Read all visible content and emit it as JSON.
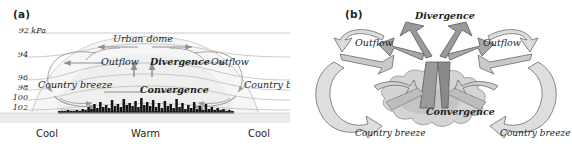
{
  "figure": {
    "width": 572,
    "height": 157,
    "background": "#ffffff"
  },
  "panel_a": {
    "label": "(a)",
    "type": "cross-section diagram",
    "pressure_axis": {
      "unit_label": "92 kPa",
      "ticks": [
        {
          "value": "92 kPa",
          "y": 31
        },
        {
          "value": "94",
          "y": 55
        },
        {
          "value": "96",
          "y": 78
        },
        {
          "value": "98",
          "y": 88
        },
        {
          "value": "100",
          "y": 98
        },
        {
          "value": "102",
          "y": 108
        }
      ]
    },
    "labels": {
      "urban_dome": "Urban dome",
      "outflow_left": "Outflow",
      "divergence": "Divergence",
      "outflow_right": "Outflow",
      "convergence": "Convergence",
      "country_breeze_left": "Country breeze",
      "country_breeze_right": "Country breeze"
    },
    "ground_labels": {
      "left": "Cool",
      "center": "Warm",
      "right": "Cool"
    },
    "colors": {
      "isobar": "#b5b5b5",
      "arrow": "#9a9a9a",
      "dome_fill": "#f2f2f2",
      "skyline": "#1a1a1a",
      "ground": "#e8e8e8",
      "text": "#231f20"
    }
  },
  "panel_b": {
    "label": "(b)",
    "type": "three-dimensional perspective diagram",
    "labels": {
      "divergence": "Divergence",
      "outflow_left": "Outflow",
      "outflow_right": "Outflow",
      "convergence": "Convergence",
      "country_breeze_left": "Country breeze",
      "country_breeze_right": "Country breeze"
    },
    "colors": {
      "arrow_light": "#d8d8d8",
      "arrow_mid": "#b0b0b0",
      "arrow_dark": "#8a8a8a",
      "city_fill": "#d0d0d0",
      "outline": "#4d4d4d",
      "text": "#231f20"
    }
  },
  "chart_data": {
    "type": "diagram",
    "panels": [
      {
        "id": "a",
        "view": "vertical cross-section",
        "ylabel": "Pressure (kPa)",
        "y_ticks": [
          92,
          94,
          96,
          98,
          100,
          102
        ],
        "ylim": [
          92,
          102
        ],
        "surface_temperature": [
          "Cool",
          "Warm",
          "Cool"
        ],
        "features": [
          "Urban dome",
          "Outflow",
          "Divergence",
          "Convergence",
          "Country breeze"
        ],
        "skyline_heights": [
          2,
          2,
          2,
          3,
          2,
          2,
          3,
          2,
          4,
          3,
          6,
          4,
          9,
          5,
          11,
          6,
          8,
          5,
          13,
          7,
          9,
          6,
          14,
          8,
          10,
          7,
          12,
          6,
          15,
          8,
          11,
          7,
          13,
          6,
          10,
          5,
          12,
          7,
          9,
          5,
          14,
          6,
          10,
          4,
          8,
          5,
          11,
          4,
          7,
          3,
          9,
          4,
          6,
          3,
          5,
          3,
          4,
          2,
          3,
          2
        ]
      },
      {
        "id": "b",
        "view": "oblique three-dimensional",
        "features": [
          "Divergence",
          "Outflow",
          "Convergence",
          "Country breeze"
        ]
      }
    ]
  }
}
